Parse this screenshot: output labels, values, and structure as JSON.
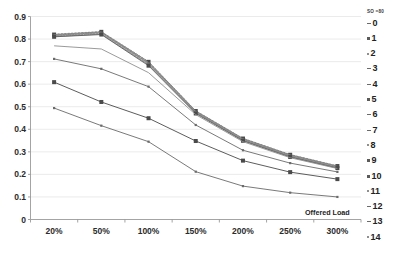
{
  "chart_data": {
    "type": "line",
    "title": "",
    "xlabel": "Offered Load",
    "ylabel": "",
    "categories": [
      "20%",
      "50%",
      "100%",
      "150%",
      "200%",
      "250%",
      "300%"
    ],
    "ylim": [
      0,
      0.9
    ],
    "ytick_labels": [
      "0.9",
      "0.8",
      "0.7",
      "0.6",
      "0.5",
      "0.4",
      "0.3",
      "0.2",
      "0.1",
      "0"
    ],
    "ytick_values": [
      0.9,
      0.8,
      0.7,
      0.6,
      0.5,
      0.4,
      0.3,
      0.2,
      0.1,
      0
    ],
    "grid": true,
    "legend_position": "right",
    "legend_title": "SO =80",
    "series": [
      {
        "name": "0",
        "values": [
          0.822,
          0.833,
          0.7,
          0.482,
          0.36,
          0.288,
          0.238
        ]
      },
      {
        "name": "1",
        "values": [
          0.82,
          0.832,
          0.699,
          0.481,
          0.359,
          0.287,
          0.237
        ]
      },
      {
        "name": "2",
        "values": [
          0.819,
          0.831,
          0.697,
          0.48,
          0.358,
          0.286,
          0.236
        ]
      },
      {
        "name": "3",
        "values": [
          0.818,
          0.83,
          0.696,
          0.479,
          0.357,
          0.285,
          0.235
        ]
      },
      {
        "name": "4",
        "values": [
          0.817,
          0.829,
          0.694,
          0.478,
          0.356,
          0.284,
          0.234
        ]
      },
      {
        "name": "5",
        "values": [
          0.816,
          0.828,
          0.693,
          0.477,
          0.355,
          0.283,
          0.233
        ]
      },
      {
        "name": "6",
        "values": [
          0.815,
          0.827,
          0.691,
          0.476,
          0.354,
          0.282,
          0.232
        ]
      },
      {
        "name": "7",
        "values": [
          0.814,
          0.826,
          0.69,
          0.475,
          0.353,
          0.281,
          0.231
        ]
      },
      {
        "name": "8",
        "values": [
          0.812,
          0.824,
          0.688,
          0.474,
          0.352,
          0.28,
          0.23
        ]
      },
      {
        "name": "9",
        "values": [
          0.811,
          0.822,
          0.686,
          0.473,
          0.351,
          0.279,
          0.229
        ]
      },
      {
        "name": "10",
        "values": [
          0.81,
          0.82,
          0.682,
          0.47,
          0.349,
          0.277,
          0.228
        ]
      },
      {
        "name": "11",
        "values": [
          0.77,
          0.756,
          0.651,
          0.465,
          0.345,
          0.274,
          0.226
        ]
      },
      {
        "name": "12",
        "values": [
          0.712,
          0.668,
          0.589,
          0.419,
          0.307,
          0.25,
          0.211
        ]
      },
      {
        "name": "13",
        "values": [
          0.609,
          0.521,
          0.449,
          0.348,
          0.261,
          0.21,
          0.179
        ]
      },
      {
        "name": "14",
        "values": [
          0.494,
          0.416,
          0.345,
          0.212,
          0.148,
          0.119,
          0.1
        ]
      }
    ]
  },
  "legend": {
    "header": "SO =80",
    "items": [
      {
        "label": "0",
        "marker": "dash"
      },
      {
        "label": "1",
        "marker": "sq"
      },
      {
        "label": "2",
        "marker": "dot"
      },
      {
        "label": "3",
        "marker": "dash"
      },
      {
        "label": "4",
        "marker": "dash"
      },
      {
        "label": "5",
        "marker": "sq"
      },
      {
        "label": "6",
        "marker": "dash"
      },
      {
        "label": "7",
        "marker": "dash"
      },
      {
        "label": "8",
        "marker": "dot"
      },
      {
        "label": "9",
        "marker": "sq"
      },
      {
        "label": "10",
        "marker": "sq"
      },
      {
        "label": "11",
        "marker": "dot"
      },
      {
        "label": "12",
        "marker": "dash"
      },
      {
        "label": "13",
        "marker": "dash"
      },
      {
        "label": "14",
        "marker": "dot"
      }
    ]
  },
  "colors": {
    "grid": "#e2e2e2",
    "axis": "#9a9a9a",
    "line": "#7d7d7d",
    "line_dark": "#4f4f4f",
    "text": "#222222",
    "background": "#ffffff"
  }
}
